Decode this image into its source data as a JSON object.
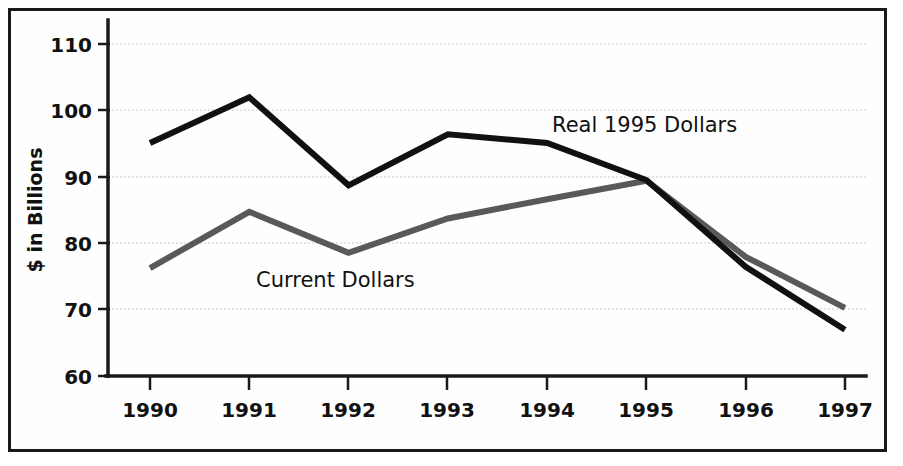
{
  "chart_data": {
    "type": "line",
    "title": "",
    "subtitle": "",
    "xlabel": "",
    "ylabel": "$ in Billions",
    "categories": [
      "1990",
      "1991",
      "1992",
      "1993",
      "1994",
      "1995",
      "1996",
      "1997"
    ],
    "x": [
      1990,
      1991,
      1992,
      1993,
      1994,
      1995,
      1996,
      1997
    ],
    "xlim": [
      1989.5,
      1997.5
    ],
    "ylim": [
      60,
      112
    ],
    "y_ticks": [
      60,
      70,
      80,
      90,
      100,
      110
    ],
    "x_ticks": [
      "1990",
      "1991",
      "1992",
      "1993",
      "1994",
      "1995",
      "1996",
      "1997"
    ],
    "grid": "horizontal-dotted",
    "legend": "inline-annotations",
    "series": [
      {
        "name": "Real 1995 Dollars",
        "color": "#111111",
        "stroke_width": 6,
        "values": [
          95.2,
          102.1,
          88.8,
          96.5,
          95.2,
          89.6,
          76.5,
          67.0
        ],
        "label_text": "Real 1995 Dollars"
      },
      {
        "name": "Current Dollars",
        "color": "#595959",
        "stroke_width": 6,
        "values": [
          76.3,
          84.8,
          78.6,
          83.8,
          86.7,
          89.5,
          78.0,
          70.3
        ],
        "label_text": "Current Dollars"
      }
    ],
    "annotations": [
      {
        "text": "Real 1995 Dollars",
        "x_px": 552,
        "y_px": 132,
        "anchor": "start",
        "series": "Real 1995 Dollars"
      },
      {
        "text": "Current Dollars",
        "x_px": 256,
        "y_px": 287,
        "anchor": "start",
        "series": "Current Dollars"
      }
    ]
  },
  "colors": {
    "frame": "#1a1a1a",
    "background": "#ffffff",
    "gridline": "#c9c9c9",
    "real_dollars": "#111111",
    "current_dollars": "#595959"
  },
  "axis": {
    "y_title": "$ in Billions",
    "y_tick_110": "110",
    "y_tick_100": "100",
    "y_tick_90": "90",
    "y_tick_80": "80",
    "y_tick_70": "70",
    "y_tick_60": "60",
    "x_tick_1990": "1990",
    "x_tick_1991": "1991",
    "x_tick_1992": "1992",
    "x_tick_1993": "1993",
    "x_tick_1994": "1994",
    "x_tick_1995": "1995",
    "x_tick_1996": "1996",
    "x_tick_1997": "1997"
  }
}
